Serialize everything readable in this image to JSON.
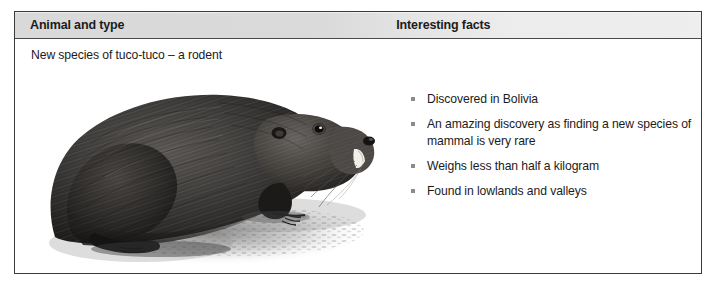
{
  "table": {
    "headers": {
      "animal": "Animal and type",
      "facts": "Interesting facts"
    },
    "row": {
      "animal_caption": "New species of tuco-tuco – a rodent",
      "illustration": {
        "name": "tuco-tuco-rodent-illustration",
        "description": "Black and white pencil illustration of a dark-furred tuco-tuco rodent facing right, sitting on shaded ground with a cast shadow"
      },
      "facts": [
        "Discovered in Bolivia",
        "An amazing discovery as finding a new species of mammal is very rare",
        "Weighs less than half a kilogram",
        "Found in lowlands and valleys"
      ]
    }
  },
  "colors": {
    "header_background_left": "#d9d9d9",
    "header_background_right": "#ececec",
    "border": "#3a3a3a",
    "text": "#1c1c1c",
    "bullet": "#8c8c8c",
    "page_background": "#ffffff"
  }
}
